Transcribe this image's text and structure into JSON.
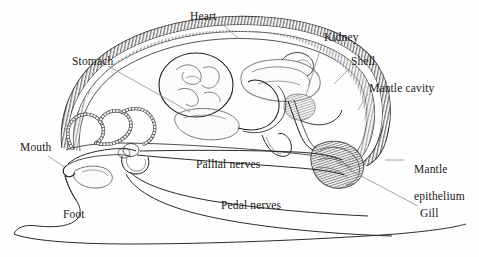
{
  "figure": {
    "background_color": "#fefefe",
    "ink_color": "#1a1a1a",
    "leader_color": "#8c8c8c",
    "labels": [
      {
        "id": "heart",
        "text": "Heart",
        "x": 190,
        "y": 10,
        "lines": [
          "Heart"
        ]
      },
      {
        "id": "stomach",
        "text": "Stomach",
        "x": 72,
        "y": 55,
        "lines": [
          "Stomach"
        ]
      },
      {
        "id": "kidney",
        "text": "Kidney",
        "x": 324,
        "y": 31,
        "lines": [
          "Kidney"
        ]
      },
      {
        "id": "shell",
        "text": "Shell",
        "x": 351,
        "y": 55,
        "lines": [
          "Shell"
        ]
      },
      {
        "id": "mantle-cavity",
        "text": "Mantle cavity",
        "x": 369,
        "y": 82,
        "lines": [
          "Mantle cavity"
        ]
      },
      {
        "id": "mouth",
        "text": "Mouth",
        "x": 20,
        "y": 141,
        "lines": [
          "Mouth"
        ]
      },
      {
        "id": "pallial-nerves",
        "text": "Pallial nerves",
        "x": 196,
        "y": 158,
        "lines": [
          "Pallial nerves"
        ]
      },
      {
        "id": "pedal-nerves",
        "text": "Pedal nerves",
        "x": 221,
        "y": 199,
        "lines": [
          "Pedal nerves"
        ]
      },
      {
        "id": "mantle-epithelium",
        "text": "Mantle epithelium",
        "x": 408,
        "y": 156,
        "lines": [
          "Mantle",
          "epithelium"
        ]
      },
      {
        "id": "gill",
        "text": "Gill",
        "x": 420,
        "y": 207,
        "lines": [
          "Gill"
        ]
      },
      {
        "id": "foot",
        "text": "Foot",
        "x": 63,
        "y": 208,
        "lines": [
          "Foot"
        ]
      }
    ],
    "structures": [
      {
        "id": "shell-arc",
        "name": "shell",
        "description": "hatched double-line arc forming dorsal shell"
      },
      {
        "id": "mantle-epithelium-band",
        "name": "mantle-epithelium",
        "description": "inner hatched band following shell, folding at right tip"
      },
      {
        "id": "stomach-organ",
        "name": "stomach",
        "description": "large stippled rounded sac with convoluted interior"
      },
      {
        "id": "heart-kidney-mass",
        "name": "heart-and-kidney",
        "description": "lobed pericardial mass right of stomach"
      },
      {
        "id": "intestine-coil",
        "name": "intestine",
        "description": "beaded segmented coiled tube at left"
      },
      {
        "id": "gill-organ",
        "name": "gill",
        "description": "striated lance-shaped ctenidium in mantle cavity"
      },
      {
        "id": "nerve-ring",
        "name": "nerve-ring-ganglia",
        "description": "paired ganglia with encircling commissure near mouth"
      },
      {
        "id": "pallial-nerve-pair",
        "name": "pallial-nerves",
        "description": "two long nerve cords running posteriorly"
      },
      {
        "id": "pedal-nerve-pair",
        "name": "pedal-nerves",
        "description": "two long nerve cords running into the foot"
      },
      {
        "id": "foot-outline",
        "name": "foot",
        "description": "large ventral muscular foot outline"
      },
      {
        "id": "mouth-region",
        "name": "mouth",
        "description": "anterior opening with buccal mass / radula sac"
      }
    ]
  }
}
